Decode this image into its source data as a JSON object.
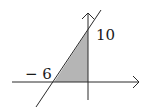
{
  "diagram": {
    "type": "coordinate-graph",
    "labels": {
      "x_intercept": "− 6",
      "y_intercept": "10"
    },
    "line": {
      "x_intercept": -6,
      "y_intercept": 10
    },
    "shaded_region": "triangle bounded by line, x-axis and y-axis",
    "colors": {
      "axes": "#2a2a2a",
      "shade": "#b5b5b5",
      "line": "#2a2a2a"
    }
  }
}
